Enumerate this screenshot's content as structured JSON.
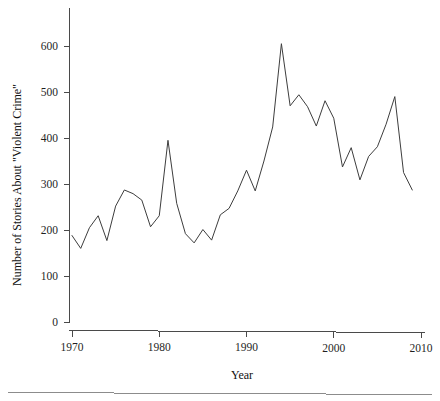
{
  "figure": {
    "background_color": "#ffffff",
    "line_color": "#3d3d3d",
    "axis_color": "#4a4a4a",
    "footer_rule_color": "#8c8c8c"
  },
  "chart_data": {
    "type": "line",
    "title": "",
    "xlabel": "Year",
    "ylabel": "Number of Stories About \"Violent Crime\"",
    "xlim": [
      1970,
      2010
    ],
    "ylim": [
      0,
      640
    ],
    "xticks": [
      1970,
      1980,
      1990,
      2000,
      2010
    ],
    "xtick_labels": [
      "1970",
      "1980",
      "1990",
      "2000",
      "2010"
    ],
    "yticks": [
      0,
      100,
      200,
      300,
      400,
      500,
      600
    ],
    "ytick_labels": [
      "0",
      "100",
      "200",
      "300",
      "400",
      "500",
      "600"
    ],
    "grid": false,
    "legend": null,
    "x": [
      1970,
      1971,
      1972,
      1973,
      1974,
      1975,
      1976,
      1977,
      1978,
      1979,
      1980,
      1981,
      1982,
      1983,
      1984,
      1985,
      1986,
      1987,
      1988,
      1989,
      1990,
      1991,
      1992,
      1993,
      1994,
      1995,
      1996,
      1997,
      1998,
      1999,
      2000,
      2001,
      2002,
      2003,
      2004,
      2005,
      2006,
      2007,
      2008,
      2009
    ],
    "values": [
      188,
      160,
      205,
      231,
      177,
      252,
      287,
      279,
      265,
      207,
      231,
      395,
      258,
      192,
      172,
      201,
      178,
      233,
      247,
      285,
      330,
      285,
      350,
      424,
      605,
      470,
      494,
      468,
      426,
      481,
      443,
      337,
      379,
      309,
      360,
      381,
      430,
      490,
      325,
      287
    ],
    "series": [
      {
        "name": "Number of Stories About \"Violent Crime\"",
        "values": [
          188,
          160,
          205,
          231,
          177,
          252,
          287,
          279,
          265,
          207,
          231,
          395,
          258,
          192,
          172,
          201,
          178,
          233,
          247,
          285,
          330,
          285,
          350,
          424,
          605,
          470,
          494,
          468,
          426,
          481,
          443,
          337,
          379,
          309,
          360,
          381,
          430,
          490,
          325,
          287
        ]
      }
    ]
  }
}
